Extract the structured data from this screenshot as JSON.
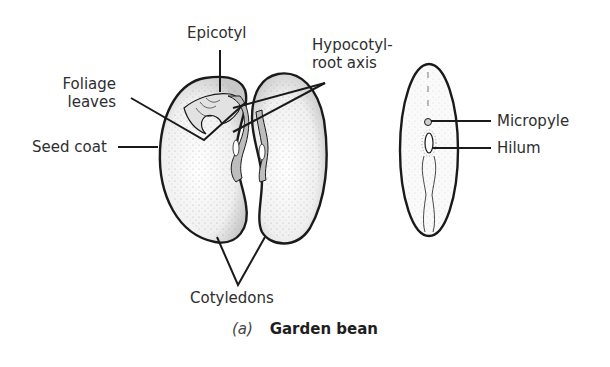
{
  "figure": {
    "caption": {
      "part": "(a)",
      "title": "Garden bean"
    },
    "labels": {
      "epicotyl": "Epicotyl",
      "hypocotyl_line1": "Hypocotyl-",
      "hypocotyl_line2": "root axis",
      "foliage_line1": "Foliage",
      "foliage_line2": "leaves",
      "seed_coat": "Seed coat",
      "cotyledons": "Cotyledons",
      "micropyle": "Micropyle",
      "hilum": "Hilum"
    },
    "colors": {
      "outline": "#1a1a1a",
      "fill": "#f2f2f2",
      "shade": "#bdbdbd",
      "text": "#2e2e2e"
    }
  }
}
